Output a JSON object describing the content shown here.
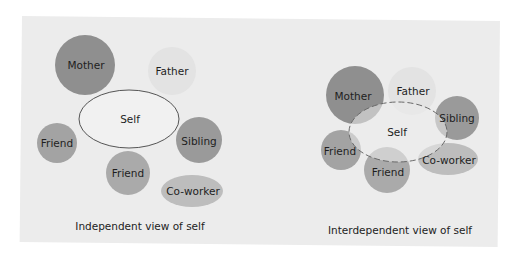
{
  "colors": {
    "background": "#ececec",
    "mother": "#8f8f8f",
    "father": "#e3e3e3",
    "friend": "#a3a3a3",
    "sibling": "#9a9a9a",
    "coworker": "#bdbdbd",
    "self_fill": "#f1f1f1",
    "self_stroke": "#555555"
  },
  "independent": {
    "caption": "Independent view of self",
    "self": "Self",
    "mother": "Mother",
    "father": "Father",
    "friend_left": "Friend",
    "friend_bottom": "Friend",
    "sibling": "Sibling",
    "coworker": "Co-worker"
  },
  "interdependent": {
    "caption": "Interdependent view of self",
    "self": "Self",
    "mother": "Mother",
    "father": "Father",
    "friend_left": "Friend",
    "friend_bottom": "Friend",
    "sibling": "Sibling",
    "coworker": "Co-worker"
  }
}
